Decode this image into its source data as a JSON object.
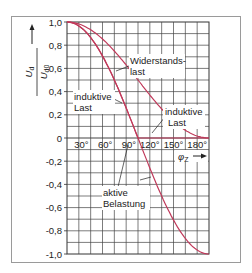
{
  "chart_data": {
    "type": "line",
    "title": "",
    "xlabel": "φ2",
    "ylabel": "Ud / Ud0",
    "xlim": [
      0,
      180
    ],
    "ylim": [
      -1.0,
      1.0
    ],
    "grid": true,
    "x_ticks": [
      "30°",
      "60°",
      "90°",
      "120°",
      "150°",
      "180°"
    ],
    "y_ticks": [
      "1,0",
      "0,8",
      "0,6",
      "0,4",
      "0,2",
      "0",
      "-0,2",
      "-0,4",
      "-0,6",
      "-0,8",
      "-1,0"
    ],
    "series": [
      {
        "name": "Widerstandslast",
        "x": [
          0,
          15,
          30,
          45,
          60,
          75,
          90,
          105,
          120,
          135,
          150,
          165,
          180
        ],
        "values": [
          1.0,
          0.98,
          0.93,
          0.85,
          0.75,
          0.62,
          0.5,
          0.37,
          0.25,
          0.15,
          0.07,
          0.02,
          0.0
        ]
      },
      {
        "name": "induktive Last",
        "x": [
          0,
          15,
          30,
          45,
          60,
          75,
          90,
          105,
          120,
          135,
          150,
          165,
          180
        ],
        "values": [
          1.0,
          0.97,
          0.87,
          0.71,
          0.5,
          0.26,
          0.0,
          0.0,
          0.0,
          0.0,
          0.0,
          0.0,
          0.0
        ]
      },
      {
        "name": "aktive Belastung",
        "x": [
          0,
          15,
          30,
          45,
          60,
          75,
          90,
          105,
          120,
          135,
          150,
          165,
          180
        ],
        "values": [
          1.0,
          0.97,
          0.87,
          0.71,
          0.5,
          0.26,
          0.0,
          -0.26,
          -0.5,
          -0.71,
          -0.87,
          -0.97,
          -1.0
        ]
      }
    ],
    "annotations": [
      {
        "text_lines": [
          "Widerstands-",
          "last"
        ]
      },
      {
        "text_lines": [
          "induktive",
          "Last"
        ],
        "side": "left"
      },
      {
        "text_lines": [
          "induktive",
          "Last"
        ],
        "side": "right"
      },
      {
        "text_lines": [
          "aktive",
          "Belastung"
        ]
      }
    ],
    "curve_color": "#c0395a"
  },
  "labels": {
    "y_num": "U",
    "y_num_sub": "d",
    "y_den": "U",
    "y_den_sub": "d0",
    "x_axis": "φ",
    "x_axis_sub": "Z",
    "ann_wid_1": "Widerstands-",
    "ann_wid_2": "last",
    "ann_ind_l_1": "induktive",
    "ann_ind_l_2": "Last",
    "ann_ind_r_1": "induktive",
    "ann_ind_r_2": "Last",
    "ann_akt_1": "aktive",
    "ann_akt_2": "Belastung"
  }
}
